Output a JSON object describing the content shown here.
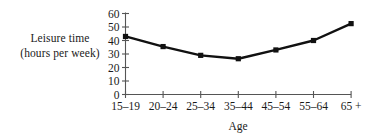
{
  "chart_data": {
    "type": "line",
    "title": "",
    "subtitle": "",
    "xlabel": "Age",
    "ylabel": "Leisure time (hours per week)",
    "ylabel_line1": "Leisure time",
    "ylabel_line2": "(hours per week)",
    "categories": [
      "15–19",
      "20–24",
      "25–34",
      "35–44",
      "45–54",
      "55–64",
      "65 +"
    ],
    "values": [
      43,
      35.5,
      29,
      26.5,
      33,
      40,
      52.5
    ],
    "series": [
      {
        "name": "Leisure time",
        "values": [
          43,
          35.5,
          29,
          26.5,
          33,
          40,
          52.5
        ]
      }
    ],
    "yticks": [
      0,
      10,
      20,
      30,
      40,
      50,
      60
    ],
    "ytick_labels": [
      "0",
      "10",
      "20",
      "30",
      "40",
      "50",
      "60"
    ],
    "ylim": [
      0,
      60
    ],
    "grid": false,
    "legend": false,
    "legend_position": "none",
    "marker": "square",
    "marker_color": "#111111",
    "line_color": "#111111",
    "axis_color": "#555555",
    "background": "#ffffff"
  }
}
